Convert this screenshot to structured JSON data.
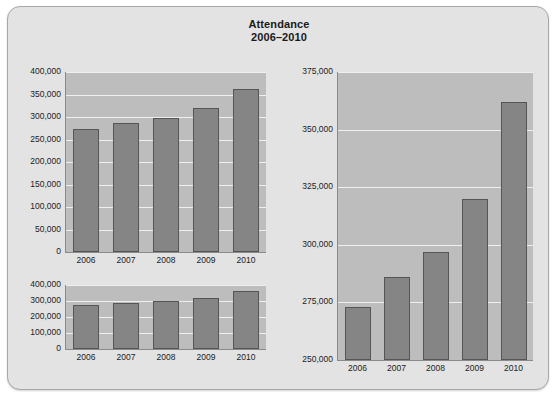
{
  "page": {
    "background_color": "#e3e3e3",
    "border_color": "#a8a8a8"
  },
  "title": {
    "line1": "Attendance",
    "line2": "2006–2010"
  },
  "style": {
    "bar_color": "#858585",
    "bar_border_color": "#555555",
    "plot_background": "#bdbdbd",
    "gridline_color": "#efefef",
    "axis_color": "#8a8a8a",
    "text_color": "#1c1c1c"
  },
  "chart_data": [
    {
      "id": "top-left",
      "type": "bar",
      "title": "Attendance 2006–2010",
      "xlabel": "",
      "ylabel": "",
      "categories": [
        "2006",
        "2007",
        "2008",
        "2009",
        "2010"
      ],
      "values": [
        273000,
        286000,
        297000,
        320000,
        362000
      ],
      "ylim": [
        0,
        400000
      ],
      "yticks": [
        0,
        50000,
        100000,
        150000,
        200000,
        250000,
        300000,
        350000,
        400000
      ],
      "ytick_labels": [
        "0",
        "50,000",
        "100,000",
        "150,000",
        "200,000",
        "250,000",
        "300,000",
        "350,000",
        "400,000"
      ],
      "grid": true,
      "legend": "none"
    },
    {
      "id": "bottom-left",
      "type": "bar",
      "title": "Attendance 2006–2010",
      "xlabel": "",
      "ylabel": "",
      "categories": [
        "2006",
        "2007",
        "2008",
        "2009",
        "2010"
      ],
      "values": [
        273000,
        286000,
        297000,
        320000,
        362000
      ],
      "ylim": [
        0,
        400000
      ],
      "yticks": [
        0,
        100000,
        200000,
        300000,
        400000
      ],
      "ytick_labels": [
        "0",
        "100,000",
        "200,000",
        "300,000",
        "400,000"
      ],
      "grid": true,
      "legend": "none"
    },
    {
      "id": "right",
      "type": "bar",
      "title": "Attendance 2006–2010",
      "xlabel": "",
      "ylabel": "",
      "categories": [
        "2006",
        "2007",
        "2008",
        "2009",
        "2010"
      ],
      "values": [
        273000,
        286000,
        297000,
        320000,
        362000
      ],
      "ylim": [
        250000,
        375000
      ],
      "yticks": [
        250000,
        275000,
        300000,
        325000,
        350000,
        375000
      ],
      "ytick_labels": [
        "250,000",
        "275,000",
        "300,000",
        "325,000",
        "350,000",
        "375,000"
      ],
      "grid": true,
      "legend": "none"
    }
  ]
}
